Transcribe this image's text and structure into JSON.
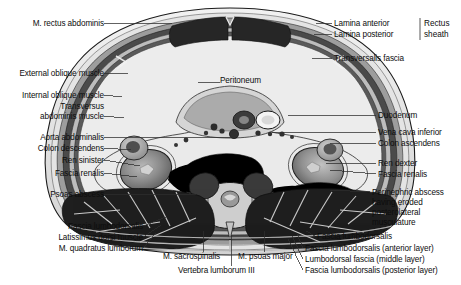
{
  "figure": {
    "modality": "anatomical cross-section drawing (grayscale)",
    "orientation": "axial / transverse section, viewed from below"
  },
  "labels_left": [
    {
      "id": "m-rectus-abdominis",
      "text": "M. rectus abdominis",
      "x": 82,
      "y": 25,
      "anchor": "right",
      "leader_to_x": 172,
      "leader_to_y": 27
    },
    {
      "id": "external-oblique-muscle",
      "text": "External oblique muscle",
      "x": 100,
      "y": 75,
      "anchor": "right",
      "leader_to_x": 128,
      "leader_to_y": 79
    },
    {
      "id": "internal-oblique-muscle",
      "text": "Internal oblique muscle",
      "x": 100,
      "y": 97,
      "anchor": "right",
      "leader_to_x": 122,
      "leader_to_y": 101
    },
    {
      "id": "transversus-abdominis-muscle-line1",
      "text": "Transversus",
      "x": 100,
      "y": 108,
      "anchor": "right"
    },
    {
      "id": "transversus-abdominis-muscle-line2",
      "text": "abdominis muscle",
      "x": 100,
      "y": 118,
      "anchor": "right",
      "leader_to_x": 124,
      "leader_to_y": 121
    },
    {
      "id": "aorta-abdominalis",
      "text": "Aorta abdominalis",
      "x": 100,
      "y": 139,
      "anchor": "right",
      "leader_to_x": 234,
      "leader_to_y": 141
    },
    {
      "id": "colon-descendens",
      "text": "Colon descendens",
      "x": 100,
      "y": 150,
      "anchor": "right",
      "leader_to_x": 131,
      "leader_to_y": 152
    },
    {
      "id": "ren-sinister",
      "text": "Ren sinister",
      "x": 100,
      "y": 162,
      "anchor": "right",
      "leader_to_x": 140,
      "leader_to_y": 168
    },
    {
      "id": "fascia-renalis-left",
      "text": "Fascia renalis",
      "x": 100,
      "y": 175,
      "anchor": "right",
      "leader_to_x": 137,
      "leader_to_y": 178
    },
    {
      "id": "psoas-abscess",
      "text": "Psoas abscess",
      "x": 100,
      "y": 196,
      "anchor": "right",
      "leader_to_x": 196,
      "leader_to_y": 196
    },
    {
      "id": "fascia-lumbodorsalis-left",
      "text": "Fascia lumbodorsalis",
      "x": 140,
      "y": 229,
      "anchor": "right",
      "leader_to_x": 166,
      "leader_to_y": 220
    },
    {
      "id": "latissimus-dorsi-muscle",
      "text": "Latissimus dorsi muscle",
      "x": 140,
      "y": 240,
      "anchor": "right",
      "leader_to_x": 161,
      "leader_to_y": 228
    },
    {
      "id": "m-quadratus-lumborum",
      "text": "M. quadratus lumborum",
      "x": 140,
      "y": 251,
      "anchor": "right",
      "leader_to_x": 156,
      "leader_to_y": 236
    }
  ],
  "labels_right": [
    {
      "id": "lamina-anterior",
      "text": "Lamina anterior",
      "x": 334,
      "y": 25,
      "anchor": "left",
      "leader_to_x": 318,
      "leader_to_y": 27
    },
    {
      "id": "lamina-posterior",
      "text": "Lamina posterior",
      "x": 334,
      "y": 36,
      "anchor": "left",
      "leader_to_x": 316,
      "leader_to_y": 38
    },
    {
      "id": "transversalis-fascia",
      "text": "Transversalis fascia",
      "x": 334,
      "y": 60,
      "anchor": "left",
      "leader_to_x": 314,
      "leader_to_y": 61
    },
    {
      "id": "duodenum",
      "text": "Duodenum",
      "x": 378,
      "y": 117,
      "anchor": "left",
      "leader_to_x": 288,
      "leader_to_y": 119
    },
    {
      "id": "vena-cava-inferior",
      "text": "Vena cava inferior",
      "x": 378,
      "y": 134,
      "anchor": "left",
      "leader_to_x": 272,
      "leader_to_y": 136
    },
    {
      "id": "colon-ascendens",
      "text": "Colon ascendens",
      "x": 378,
      "y": 145,
      "anchor": "left",
      "leader_to_x": 330,
      "leader_to_y": 147
    },
    {
      "id": "ren-dexter",
      "text": "Ren dexter",
      "x": 378,
      "y": 165,
      "anchor": "left",
      "leader_to_x": 326,
      "leader_to_y": 167
    },
    {
      "id": "fascia-renalis-right",
      "text": "Fascia renalis",
      "x": 378,
      "y": 176,
      "anchor": "left",
      "leader_to_x": 330,
      "leader_to_y": 172
    },
    {
      "id": "perinephric-abscess-line1",
      "text": "Perinephric abscess",
      "x": 372,
      "y": 194,
      "anchor": "left",
      "leader_to_x": 330,
      "leader_to_y": 192
    },
    {
      "id": "perinephric-abscess-line2",
      "text": "having eroded",
      "x": 372,
      "y": 204,
      "anchor": "left"
    },
    {
      "id": "perinephric-abscess-line3",
      "text": "posterolateral",
      "x": 372,
      "y": 214,
      "anchor": "left"
    },
    {
      "id": "perinephric-abscess-line4",
      "text": "musculature",
      "x": 372,
      "y": 224,
      "anchor": "left"
    }
  ],
  "labels_center": [
    {
      "id": "peritoneum",
      "text": "Peritoneum",
      "x": 222,
      "y": 81,
      "anchor": "left",
      "leader_to_x": 210,
      "leader_to_y": 84
    }
  ],
  "labels_bottom": [
    {
      "id": "m-sacrospinalis",
      "text": "M. sacrospinalis",
      "x": 163,
      "y": 257,
      "anchor": "left",
      "leader_to_x": 203,
      "leader_to_y": 231
    },
    {
      "id": "vertebra-lumborum-iii",
      "text": "Vertebra lumborum III",
      "x": 178,
      "y": 271,
      "anchor": "left",
      "leader_to_x": 231,
      "leader_to_y": 236
    },
    {
      "id": "m-psoas-major",
      "text": "M. psoas major",
      "x": 238,
      "y": 257,
      "anchor": "left",
      "leader_to_x": 264,
      "leader_to_y": 231
    }
  ],
  "labels_bottom_right": [
    {
      "id": "fascia-lumbodorsalis-plain",
      "text": "Fascia lumbodorsalis",
      "x": 317,
      "y": 238,
      "anchor": "left",
      "leader_to_x": 306,
      "leader_to_y": 231
    },
    {
      "id": "fascia-lumbodorsalis-anterior",
      "text": "Fascia lumbodorsalis (anterior layer)",
      "x": 305,
      "y": 250,
      "anchor": "left",
      "leader_to_x": 297,
      "leader_to_y": 234
    },
    {
      "id": "lumbodorsal-fascia-middle",
      "text": "Lumbodorsal fascia (middle layer)",
      "x": 305,
      "y": 261,
      "anchor": "left",
      "leader_to_x": 292,
      "leader_to_y": 236
    },
    {
      "id": "fascia-lumbodorsalis-posterior",
      "text": "Fascia lumbodorsalis (posterior layer)",
      "x": 305,
      "y": 272,
      "anchor": "left",
      "leader_to_x": 288,
      "leader_to_y": 239
    }
  ],
  "brace": {
    "id": "rectus-sheath-brace",
    "line1": "Rectus",
    "line2": "sheath",
    "x": 425,
    "y": 22,
    "bracket_x": 420,
    "bracket_top": 20,
    "bracket_bottom": 43
  },
  "colors": {
    "background": "#ffffff",
    "label_text": "#0d0d0d",
    "leader_line": "#303030",
    "outline": "#1a1a1a",
    "skin_light": "#e8e8e8",
    "fat_pale": "#f0f0f0",
    "muscle_dark": "#2a2a2a",
    "muscle_mid": "#6b6b6b",
    "viscera_gray": "#9a9a9a",
    "abscess_black": "#000000",
    "bone_light": "#d8d8d8"
  }
}
